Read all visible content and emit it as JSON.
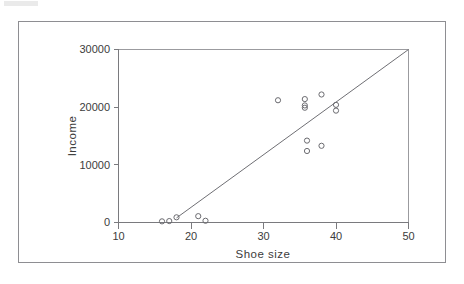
{
  "chart_data": {
    "type": "scatter",
    "title": "",
    "xlabel": "Shoe size",
    "ylabel": "Income",
    "xlim": [
      10,
      50
    ],
    "ylim": [
      0,
      30000
    ],
    "xticks": [
      "10",
      "20",
      "30",
      "40",
      "50"
    ],
    "xtick_values": [
      10,
      20,
      30,
      40,
      50
    ],
    "yticks": [
      "0",
      "10000",
      "20000",
      "30000"
    ],
    "ytick_values": [
      0,
      10000,
      20000,
      30000
    ],
    "grid": false,
    "legend": null,
    "marker_style": "open-circle",
    "points": [
      {
        "x": 16.0,
        "y": 200
      },
      {
        "x": 17.0,
        "y": 250
      },
      {
        "x": 18.0,
        "y": 900
      },
      {
        "x": 21.0,
        "y": 1100
      },
      {
        "x": 22.0,
        "y": 300
      },
      {
        "x": 32.0,
        "y": 21200
      },
      {
        "x": 35.7,
        "y": 21400
      },
      {
        "x": 35.7,
        "y": 20300
      },
      {
        "x": 35.7,
        "y": 19900
      },
      {
        "x": 36.0,
        "y": 14200
      },
      {
        "x": 36.0,
        "y": 12400
      },
      {
        "x": 38.0,
        "y": 22200
      },
      {
        "x": 38.0,
        "y": 13300
      },
      {
        "x": 40.0,
        "y": 20400
      },
      {
        "x": 40.0,
        "y": 19400
      }
    ],
    "series": [
      {
        "name": "Income vs Shoe size",
        "x": [
          16.0,
          17.0,
          18.0,
          21.0,
          22.0,
          32.0,
          35.7,
          35.7,
          35.7,
          36.0,
          36.0,
          38.0,
          38.0,
          40.0,
          40.0
        ],
        "values": [
          200,
          250,
          900,
          1100,
          300,
          21200,
          21400,
          20300,
          19900,
          14200,
          12400,
          22200,
          13300,
          20400,
          19400
        ]
      }
    ],
    "fit_line": {
      "name": "regression-line",
      "x_start": 18.0,
      "y_start": 800,
      "x_end": 50.0,
      "y_end": 30000
    },
    "colors": {
      "marker_stroke": "#6b6b70",
      "fit_line": "#6f6f74",
      "axis": "#7a7a7e",
      "frame": "#9b9b9f",
      "text": "#3c3c3c",
      "background": "#ffffff"
    }
  }
}
